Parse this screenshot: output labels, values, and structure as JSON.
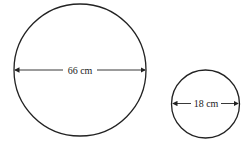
{
  "diagram": {
    "shapes": [
      {
        "type": "circle",
        "name": "large-circle",
        "diameter_label": "66 cm"
      },
      {
        "type": "circle",
        "name": "small-circle",
        "diameter_label": "18 cm"
      }
    ]
  },
  "colors": {
    "stroke": "#222222",
    "background": "#ffffff"
  }
}
